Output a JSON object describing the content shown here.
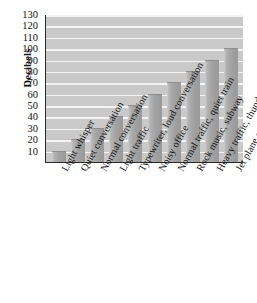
{
  "chart_data": {
    "type": "bar",
    "title": "",
    "xlabel": "",
    "ylabel": "Decibels",
    "ylim": [
      0,
      130
    ],
    "ytick_step": 10,
    "yticks": [
      130,
      120,
      110,
      100,
      90,
      80,
      70,
      60,
      50,
      40,
      30,
      20,
      10
    ],
    "grid": true,
    "legend": "none",
    "categories": [
      "Light whisper",
      "Quiet conversation",
      "Normal conversation",
      "Light traffic",
      "Typewriter, loud conversation",
      "Noisy office",
      "Normal traffic, quiet train",
      "Rock music, subway",
      "Heavy traffic, thunder",
      "Jet plane at takeoff"
    ],
    "values": [
      10,
      20,
      30,
      40,
      50,
      60,
      70,
      80,
      90,
      100
    ],
    "colors": {
      "plot_background": "#c9c9c9",
      "gridline": "#f4f4f4",
      "bar": "#a6a6a6",
      "axis": "#2b2b2b",
      "text": "#111111"
    }
  }
}
